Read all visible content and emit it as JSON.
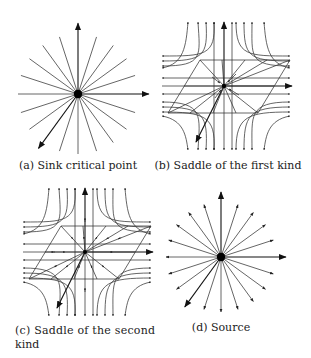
{
  "figure": {
    "panels": [
      {
        "id": "a",
        "caption": "(a) Sink critical point",
        "type": "sink"
      },
      {
        "id": "b",
        "caption": "(b) Saddle of the first kind",
        "type": "saddle-first"
      },
      {
        "id": "c",
        "caption_line1": "(c) Saddle of the second",
        "caption_line2": "kind",
        "type": "saddle-second"
      },
      {
        "id": "d",
        "caption": "(d) Source",
        "type": "source"
      }
    ],
    "ray_count": 20,
    "stroke_color": "#333333",
    "point_color": "#000000"
  }
}
